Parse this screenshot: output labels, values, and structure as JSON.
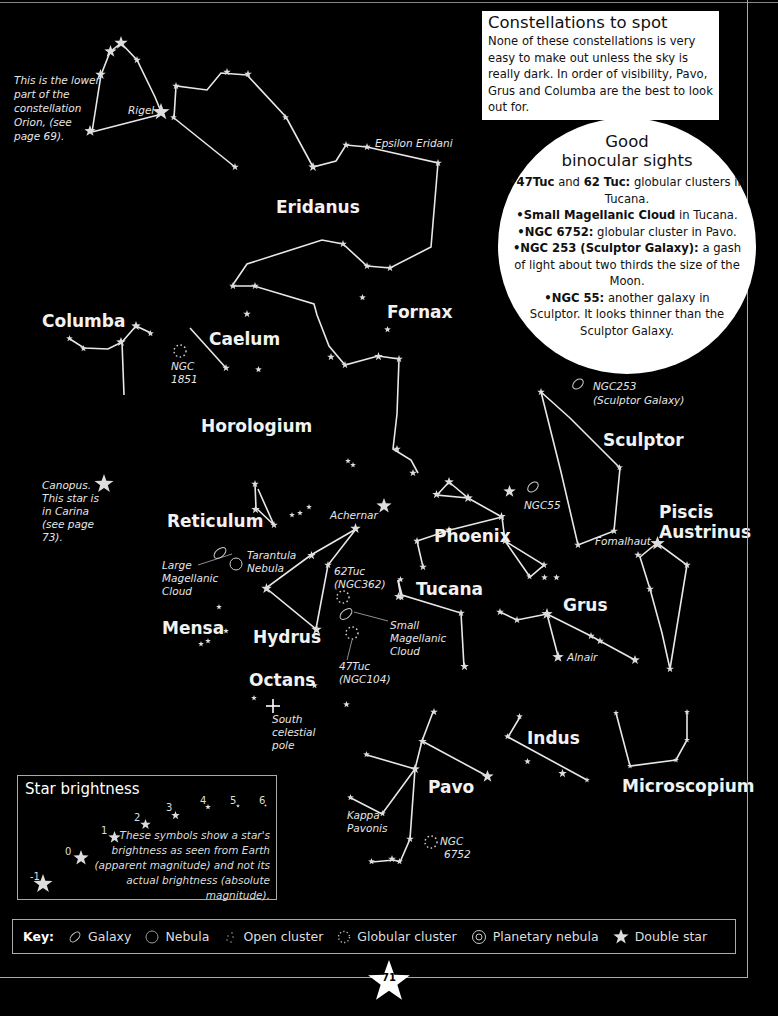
{
  "page": {
    "number": "71"
  },
  "constellations_to_spot": {
    "title": "Constellations to spot",
    "text": "None of these constellations is very easy to make out unless the sky is really dark. In order of visibility, Pavo, Grus and Columba are the best to look out for."
  },
  "binocular_sights": {
    "title_line1": "Good",
    "title_line2": "binocular sights",
    "items": [
      {
        "bold": "47Tuc",
        "mid": " and ",
        "bold2": "62 Tuc:",
        "text": " globular clusters in Tucana."
      },
      {
        "bold": "Small Magellanic Cloud",
        "text": " in Tucana."
      },
      {
        "bold": "NGC 6752:",
        "text": " globular cluster in Pavo."
      },
      {
        "bold": "NGC 253 (Sculptor Galaxy):",
        "text": " a gash of light about two thirds the size of the Moon."
      },
      {
        "bold": "NGC 55:",
        "text": " another galaxy in Sculptor. It looks thinner than the Sculptor Galaxy."
      }
    ]
  },
  "constellation_names": {
    "eridanus": "Eridanus",
    "fornax": "Fornax",
    "columba": "Columba",
    "caelum": "Caelum",
    "horologium": "Horologium",
    "sculptor": "Sculptor",
    "reticulum": "Reticulum",
    "phoenix": "Phoenix",
    "piscis": "Piscis",
    "austrinus": "Austrinus",
    "tucana": "Tucana",
    "grus": "Grus",
    "mensa": "Mensa",
    "hydrus": "Hydrus",
    "octans": "Octans",
    "indus": "Indus",
    "pavo": "Pavo",
    "microscopium": "Microscopium"
  },
  "annotations": {
    "orion_note": [
      "This is the lower",
      "part of the",
      "constellation",
      "Orion, (see",
      "page 69)."
    ],
    "rigel": "Rigel",
    "epsilon_eridani": "Epsilon Eridani",
    "ngc1851": [
      "NGC",
      "1851"
    ],
    "ngc253": [
      "NGC253",
      "(Sculptor Galaxy)"
    ],
    "canopus": [
      "Canopus.",
      "This star is",
      "in Carina",
      "(see page",
      "73)."
    ],
    "achernar": "Achernar",
    "ngc55": "NGC55",
    "fomalhaut": "Fomalhaut",
    "lmc": [
      "Large",
      "Magellanic",
      "Cloud"
    ],
    "tarantula": [
      "Tarantula",
      "Nebula"
    ],
    "tuc62": [
      "62Tuc",
      "(NGC362)"
    ],
    "smc": [
      "Small",
      "Magellanic",
      "Cloud"
    ],
    "tuc47": [
      "47Tuc",
      "(NGC104)"
    ],
    "alnair": "Alnair",
    "south_pole": [
      "South",
      "celestial",
      "pole"
    ],
    "kappa_pavonis": [
      "Kappa",
      "Pavonis"
    ],
    "ngc6752": [
      "NGC",
      "6752"
    ]
  },
  "star_brightness": {
    "title": "Star brightness",
    "magnitudes": [
      "-1",
      "0",
      "1",
      "2",
      "3",
      "4",
      "5",
      "6"
    ],
    "note": "These symbols show a star's brightness as seen from Earth (apparent magnitude) and not its actual brightness (absolute magnitude)."
  },
  "key": {
    "label": "Key:",
    "items": [
      {
        "icon": "galaxy-icon",
        "label": "Galaxy"
      },
      {
        "icon": "nebula-icon",
        "label": "Nebula"
      },
      {
        "icon": "open-cluster-icon",
        "label": "Open cluster"
      },
      {
        "icon": "globular-cluster-icon",
        "label": "Globular cluster"
      },
      {
        "icon": "planetary-nebula-icon",
        "label": "Planetary nebula"
      },
      {
        "icon": "double-star-icon",
        "label": "Double star"
      }
    ]
  },
  "colors": {
    "background": "#000000",
    "lines": "#e8e8e8",
    "stars": "#dddddd",
    "panel": "#ffffff"
  }
}
